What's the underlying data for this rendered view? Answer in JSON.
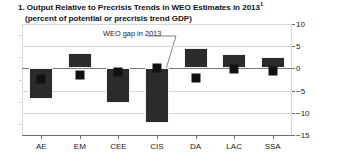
{
  "chart_data": {
    "type": "bar",
    "title": "1. Output Relative to Precrisis Trends in WEO Estimates in 2013",
    "title_superscript": "1",
    "subtitle": "(percent of potential or precrisis trend GDP)",
    "xlabel": "",
    "ylabel": "",
    "ylim": [
      -15,
      10
    ],
    "yticks": [
      10,
      5,
      0,
      -5,
      -10,
      -15
    ],
    "ytick_labels": [
      "10",
      "5",
      "0",
      "-5",
      "-10",
      "-15"
    ],
    "grid": true,
    "legend_position": "none",
    "categories": [
      "AE",
      "EM",
      "CEE",
      "CIS",
      "DA",
      "LAC",
      "SSA"
    ],
    "series": [
      {
        "name": "Output relative to precrisis trend",
        "type": "bar",
        "color": "#2b2b2b",
        "values": [
          -6.8,
          3.5,
          -7.7,
          -12.4,
          4.6,
          3.2,
          2.6
        ]
      },
      {
        "name": "WEO gap in 2013",
        "type": "marker",
        "color": "#111111",
        "values": [
          -2.3,
          -1.4,
          -0.8,
          0.1,
          -2.2,
          -0.1,
          -0.6
        ]
      }
    ],
    "annotations": [
      {
        "text": "WEO gap in 2013",
        "target_category": "CIS",
        "target_value": 0.1
      }
    ]
  },
  "colors": {
    "bar": "#2b2b2b",
    "marker": "#111111",
    "axis": "#6e6e6e",
    "grid": "#d8d8d8",
    "text": "#1a1a1a",
    "background": "#ffffff"
  }
}
